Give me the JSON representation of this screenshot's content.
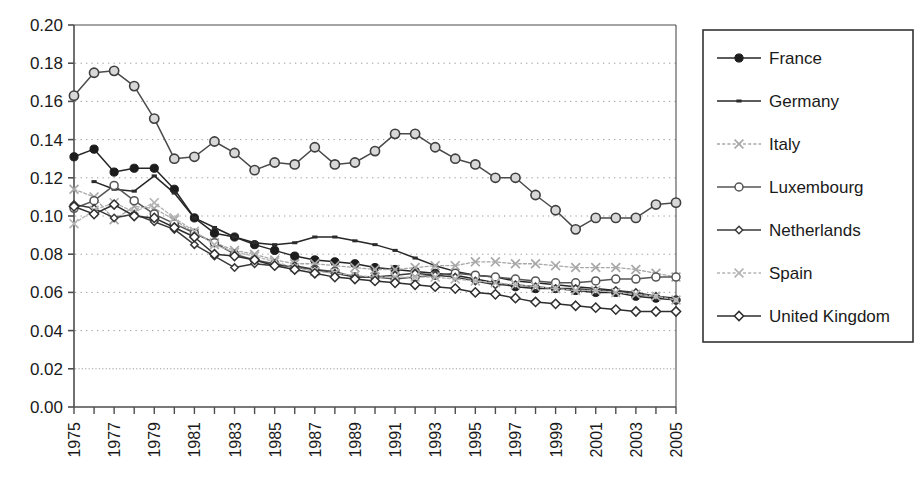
{
  "chart_data": {
    "type": "line",
    "title": "",
    "xlabel": "",
    "ylabel": "",
    "xlim": [
      1975,
      2005
    ],
    "ylim": [
      0.0,
      0.2
    ],
    "ytick_step": 0.02,
    "grid": true,
    "grid_orientation": "horizontal",
    "legend_position": "right",
    "ytick_labels": [
      "0.20",
      "0.18",
      "0.16",
      "0.14",
      "0.12",
      "0.10",
      "0.08",
      "0.06",
      "0.04",
      "0.02",
      "0.00"
    ],
    "ytick_values": [
      0.2,
      0.18,
      0.16,
      0.14,
      0.12,
      0.1,
      0.08,
      0.06,
      0.04,
      0.02,
      0.0
    ],
    "xtick_labels": [
      "1975",
      "1977",
      "1979",
      "1981",
      "1983",
      "1985",
      "1987",
      "1989",
      "1991",
      "1993",
      "1995",
      "1997",
      "1999",
      "2001",
      "2003",
      "2005"
    ],
    "xtick_values": [
      1975,
      1977,
      1979,
      1981,
      1983,
      1985,
      1987,
      1989,
      1991,
      1993,
      1995,
      1997,
      1999,
      2001,
      2003,
      2005
    ],
    "x": [
      1975,
      1976,
      1977,
      1978,
      1979,
      1980,
      1981,
      1982,
      1983,
      1984,
      1985,
      1986,
      1987,
      1988,
      1989,
      1990,
      1991,
      1992,
      1993,
      1994,
      1995,
      1996,
      1997,
      1998,
      1999,
      2000,
      2001,
      2002,
      2003,
      2004,
      2005
    ],
    "series": [
      {
        "name": "France",
        "marker": "filled-circle",
        "color": "#262626",
        "values": [
          0.131,
          0.135,
          0.123,
          0.125,
          0.125,
          0.114,
          0.099,
          0.091,
          0.089,
          0.085,
          0.082,
          0.079,
          0.077,
          0.076,
          0.075,
          0.073,
          0.072,
          0.071,
          0.07,
          0.069,
          0.067,
          0.065,
          0.063,
          0.062,
          0.062,
          0.061,
          0.06,
          0.06,
          0.058,
          0.057,
          0.056
        ]
      },
      {
        "name": "Germany",
        "marker": "line-only",
        "color": "#262626",
        "values": [
          null,
          0.118,
          0.114,
          0.113,
          0.121,
          0.112,
          0.099,
          0.094,
          0.089,
          0.086,
          0.085,
          0.086,
          0.089,
          0.089,
          0.087,
          0.085,
          0.082,
          0.078,
          0.074,
          0.071,
          0.069,
          0.068,
          0.066,
          0.065,
          0.064,
          0.063,
          0.062,
          0.061,
          0.059,
          0.058,
          0.057
        ]
      },
      {
        "name": "Italy",
        "marker": "cross",
        "color": "#a8a8a8",
        "values": [
          0.114,
          0.11,
          0.098,
          0.105,
          0.104,
          0.098,
          0.091,
          0.086,
          0.082,
          0.08,
          0.077,
          0.075,
          0.075,
          0.074,
          0.073,
          0.072,
          0.072,
          0.073,
          0.074,
          0.074,
          0.076,
          0.076,
          0.075,
          0.075,
          0.074,
          0.073,
          0.073,
          0.073,
          0.072,
          0.07,
          0.068
        ]
      },
      {
        "name": "Luxembourg",
        "marker": "open-circle",
        "color": "#555555",
        "values": [
          0.104,
          0.108,
          0.116,
          0.108,
          0.101,
          0.096,
          0.091,
          0.086,
          0.08,
          0.077,
          0.075,
          0.073,
          0.072,
          0.071,
          0.068,
          0.068,
          0.067,
          0.068,
          0.069,
          0.07,
          0.069,
          0.068,
          0.067,
          0.066,
          0.065,
          0.065,
          0.066,
          0.067,
          0.067,
          0.068,
          0.068
        ]
      },
      {
        "name": "Netherlands",
        "marker": "small-open-diamond",
        "color": "#3a3a3a",
        "values": [
          0.106,
          0.104,
          0.099,
          0.101,
          0.097,
          0.093,
          0.085,
          0.079,
          0.073,
          0.075,
          0.074,
          0.074,
          0.072,
          0.07,
          0.068,
          0.068,
          0.069,
          0.07,
          0.069,
          0.068,
          0.066,
          0.064,
          0.064,
          0.063,
          0.062,
          0.062,
          0.061,
          0.061,
          0.06,
          0.058,
          0.056
        ]
      },
      {
        "name": "Spain",
        "marker": "cross",
        "color": "#b4b4b4",
        "values": [
          0.096,
          0.103,
          0.107,
          0.102,
          0.107,
          0.099,
          0.092,
          0.085,
          0.081,
          0.079,
          0.076,
          0.073,
          0.071,
          0.07,
          0.069,
          0.068,
          0.068,
          0.068,
          0.068,
          0.067,
          0.066,
          0.065,
          0.064,
          0.063,
          0.062,
          0.061,
          0.061,
          0.06,
          0.059,
          0.058,
          0.056
        ]
      },
      {
        "name": "United Kingdom",
        "marker": "open-diamond",
        "color": "#2e2e2e",
        "values": [
          0.105,
          0.101,
          0.106,
          0.1,
          0.099,
          0.094,
          0.089,
          0.08,
          0.079,
          0.077,
          0.074,
          0.072,
          0.07,
          0.068,
          0.067,
          0.066,
          0.065,
          0.064,
          0.063,
          0.062,
          0.06,
          0.059,
          0.057,
          0.055,
          0.054,
          0.053,
          0.052,
          0.051,
          0.05,
          0.05,
          0.05
        ]
      }
    ],
    "overlay_series": [
      {
        "name": "United Kingdom",
        "marker": "open-circle-large",
        "color": "#4a4a4a",
        "values": [
          0.163,
          0.175,
          0.176,
          0.168,
          0.151,
          0.13,
          0.131,
          0.139,
          0.133,
          0.124,
          0.128,
          0.127,
          0.136,
          0.127,
          0.128,
          0.134,
          0.143,
          0.143,
          0.136,
          0.13,
          0.127,
          0.12,
          0.12,
          0.111,
          0.103,
          0.093,
          0.099,
          0.099,
          0.099,
          0.106,
          0.107
        ]
      }
    ]
  },
  "legend": {
    "items": [
      {
        "label": "France",
        "marker": "filled-circle",
        "color": "#262626"
      },
      {
        "label": "Germany",
        "marker": "line-only",
        "color": "#262626"
      },
      {
        "label": "Italy",
        "marker": "cross",
        "color": "#a8a8a8"
      },
      {
        "label": "Luxembourg",
        "marker": "open-circle",
        "color": "#555555"
      },
      {
        "label": "Netherlands",
        "marker": "small-open-diamond",
        "color": "#3a3a3a"
      },
      {
        "label": "Spain",
        "marker": "cross",
        "color": "#b4b4b4"
      },
      {
        "label": "United Kingdom",
        "marker": "open-diamond",
        "color": "#2e2e2e"
      }
    ]
  },
  "colors": {
    "axis": "#4d4d4d",
    "grid": "#9a9a9a",
    "text": "#1a1a1a",
    "background": "#ffffff",
    "legend_border": "#333333"
  }
}
